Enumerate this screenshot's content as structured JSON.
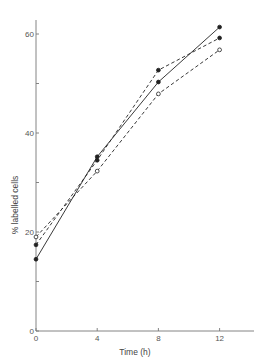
{
  "chart_data": {
    "type": "line",
    "title": "",
    "xlabel": "Time (h)",
    "ylabel": "% labelled cells",
    "x": [
      0,
      4,
      8,
      12
    ],
    "xlim": [
      0,
      14
    ],
    "ylim": [
      0,
      63
    ],
    "xticks": [
      0,
      4,
      8,
      12
    ],
    "xtick_labels": [
      "0",
      "4",
      "8",
      "12"
    ],
    "yticks": [
      0,
      20,
      40,
      60
    ],
    "ytick_labels": [
      "0",
      "20",
      "40",
      "60"
    ],
    "yminor_ticks": [
      10,
      30,
      50
    ],
    "grid": false,
    "legend": null,
    "series": [
      {
        "name": "series-1-solid-filled",
        "line_style": "solid",
        "marker": "filled-circle",
        "values": [
          14.5,
          35.2,
          50.3,
          61.4
        ]
      },
      {
        "name": "series-2-dashed-filled",
        "line_style": "dashed",
        "marker": "filled-circle",
        "values": [
          17.4,
          34.5,
          52.7,
          59.2
        ]
      },
      {
        "name": "series-3-dashed-open",
        "line_style": "dashed",
        "marker": "open-circle",
        "values": [
          19.0,
          32.3,
          47.9,
          56.8
        ]
      }
    ]
  },
  "colors": {
    "ink": "#222222",
    "axis": "#777777",
    "text": "#555555"
  }
}
